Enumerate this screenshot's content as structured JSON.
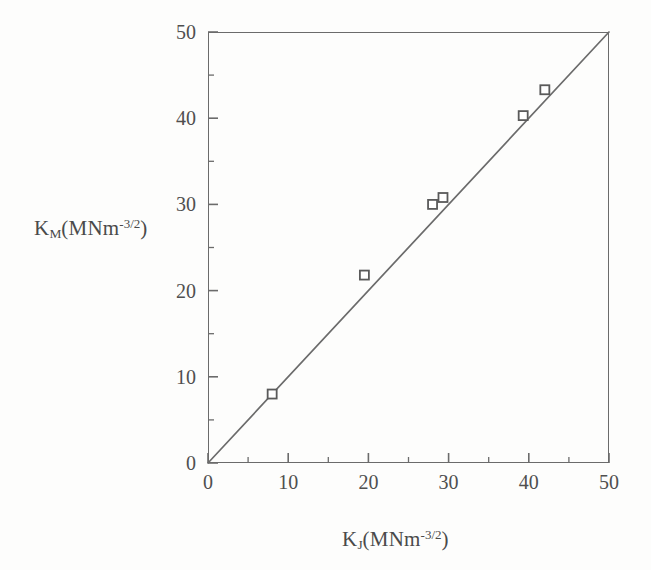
{
  "chart_data": {
    "type": "scatter",
    "title": "",
    "subtitle": "",
    "xlabel_text": "K_J(MNm^-3/2)",
    "ylabel_text": "K_M(MNm^-3/2)",
    "xlabel_parts": {
      "symbol": "K",
      "subscript": "J",
      "open": "(MNm",
      "superscript": "-3/2",
      "close": ")"
    },
    "ylabel_parts": {
      "symbol": "K",
      "subscript": "M",
      "open": "(MNm",
      "superscript": "-3/2",
      "close": ")"
    },
    "xlim": [
      0,
      50
    ],
    "ylim": [
      0,
      50
    ],
    "xticks": [
      0,
      10,
      20,
      30,
      40,
      50
    ],
    "yticks": [
      0,
      10,
      20,
      30,
      40,
      50
    ],
    "xticklabels": [
      "0",
      "10",
      "20",
      "30",
      "40",
      "50"
    ],
    "yticklabels": [
      "0",
      "10",
      "20",
      "30",
      "40",
      "50"
    ],
    "minor_tick_interval": 5,
    "tick_direction": "in",
    "grid": false,
    "legend": null,
    "series": [
      {
        "name": "data",
        "marker": "open-square",
        "marker_color": "#5a5a5a",
        "points": [
          {
            "x": 8.0,
            "y": 8.0
          },
          {
            "x": 19.5,
            "y": 21.8
          },
          {
            "x": 28.0,
            "y": 30.0
          },
          {
            "x": 29.3,
            "y": 30.8
          },
          {
            "x": 39.3,
            "y": 40.3
          },
          {
            "x": 42.0,
            "y": 43.3
          }
        ]
      },
      {
        "name": "parity-line",
        "type": "line",
        "line_color": "#6b6b6b",
        "points": [
          {
            "x": 0,
            "y": 0
          },
          {
            "x": 50,
            "y": 50
          }
        ]
      }
    ],
    "colors": {
      "ink": "#4a4a4a",
      "axis": "#6b6b6b",
      "marker": "#5a5a5a",
      "background": "#fdfdfc"
    }
  }
}
